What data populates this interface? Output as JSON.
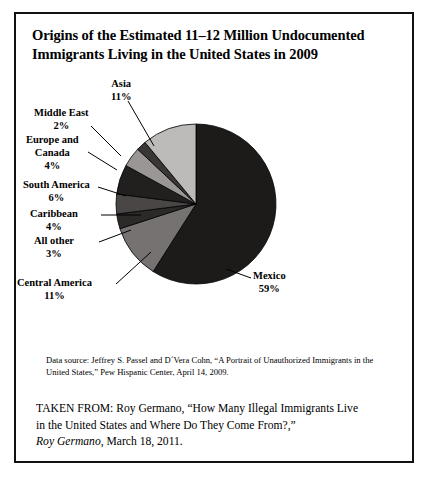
{
  "figure": {
    "title_line1": "Origins of the Estimated 11–12 Million Undocumented",
    "title_line2": "Immigrants Living in the United States in 2009",
    "data_source": "Data source: Jeffrey S. Passel and D´Vera Cohn, “A Portrait of Unauthorized Immigrants in the United States,” Pew Hispanic Center, April 14, 2009.",
    "taken_from_line1": "TAKEN FROM: Roy Germano, “How Many Illegal Immigrants Live",
    "taken_from_line2": "in the United States and Where Do They Come From?,”",
    "taken_from_attribution": "Roy Germano",
    "taken_from_date": ", March 18, 2011."
  },
  "chart_data": {
    "type": "pie",
    "title": "Origins of the Estimated 11–12 Million Undocumented Immigrants Living in the United States in 2009",
    "unit": "percent",
    "total_label": "11–12 Million Undocumented Immigrants",
    "start_angle_deg": 0,
    "direction": "clockwise",
    "legend": "none",
    "labels_style": "callout-with-leader-lines",
    "categories": [
      "Mexico",
      "Central America",
      "All other",
      "Caribbean",
      "South America",
      "Europe and Canada",
      "Middle East",
      "Asia"
    ],
    "values": [
      59,
      11,
      3,
      4,
      6,
      4,
      2,
      11
    ],
    "colors": [
      "#1d1a1a",
      "#767272",
      "#2c2929",
      "#4a4646",
      "#221f1f",
      "#9a9696",
      "#3a3636",
      "#bdbaba"
    ],
    "slices": [
      {
        "name": "Mexico",
        "label": "Mexico",
        "pct_label": "59%",
        "value": 59,
        "color": "#1d1a1a"
      },
      {
        "name": "Central America",
        "label": "Central America",
        "pct_label": "11%",
        "value": 11,
        "color": "#767272"
      },
      {
        "name": "All other",
        "label": "All other",
        "pct_label": "3%",
        "value": 3,
        "color": "#2c2929"
      },
      {
        "name": "Caribbean",
        "label": "Caribbean",
        "pct_label": "4%",
        "value": 4,
        "color": "#4a4646"
      },
      {
        "name": "South America",
        "label": "South America",
        "pct_label": "6%",
        "value": 6,
        "color": "#221f1f"
      },
      {
        "name": "Europe and Canada",
        "label": "Europe and",
        "label2": "Canada",
        "pct_label": "4%",
        "value": 4,
        "color": "#9a9696"
      },
      {
        "name": "Middle East",
        "label": "Middle East",
        "pct_label": "2%",
        "value": 2,
        "color": "#3a3636"
      },
      {
        "name": "Asia",
        "label": "Asia",
        "pct_label": "11%",
        "value": 11,
        "color": "#bdbaba"
      }
    ]
  }
}
